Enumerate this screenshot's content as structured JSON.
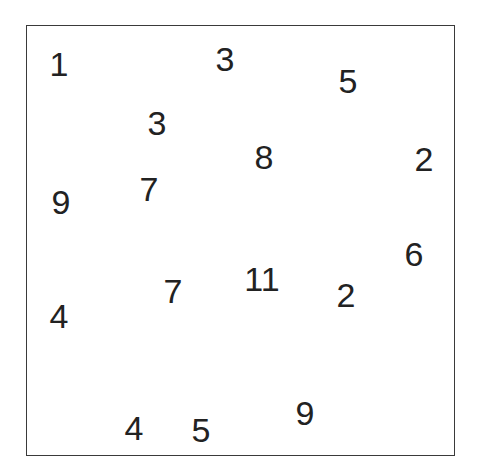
{
  "numbers": [
    {
      "value": "1",
      "x": 59,
      "y": 64
    },
    {
      "value": "3",
      "x": 225,
      "y": 59
    },
    {
      "value": "5",
      "x": 348,
      "y": 81
    },
    {
      "value": "3",
      "x": 157,
      "y": 123
    },
    {
      "value": "8",
      "x": 264,
      "y": 157
    },
    {
      "value": "2",
      "x": 424,
      "y": 159
    },
    {
      "value": "9",
      "x": 61,
      "y": 202
    },
    {
      "value": "7",
      "x": 149,
      "y": 189
    },
    {
      "value": "6",
      "x": 414,
      "y": 254
    },
    {
      "value": "11",
      "x": 262,
      "y": 279
    },
    {
      "value": "7",
      "x": 173,
      "y": 291
    },
    {
      "value": "2",
      "x": 346,
      "y": 295
    },
    {
      "value": "4",
      "x": 59,
      "y": 316
    },
    {
      "value": "9",
      "x": 305,
      "y": 413
    },
    {
      "value": "4",
      "x": 134,
      "y": 428
    },
    {
      "value": "5",
      "x": 201,
      "y": 430
    }
  ]
}
